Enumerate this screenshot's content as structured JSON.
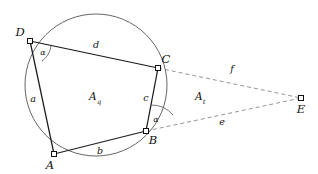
{
  "figure": {
    "canvas": {
      "width": 318,
      "height": 174
    },
    "colors": {
      "background": "#ffffff",
      "stroke_solid": "#1a1a1a",
      "stroke_circle": "#555555",
      "stroke_dashed": "#8a8a8a",
      "stroke_arc": "#555555",
      "vertex_fill": "#ffffff",
      "vertex_stroke": "#111111",
      "text": "#111111"
    },
    "circle": {
      "cx": 96,
      "cy": 85,
      "r": 71
    },
    "vertices": [
      {
        "id": "A",
        "label": "A",
        "x": 54,
        "y": 154,
        "label_x": 50,
        "label_y": 166
      },
      {
        "id": "B",
        "label": "B",
        "x": 146,
        "y": 131,
        "label_x": 153,
        "label_y": 141
      },
      {
        "id": "C",
        "label": "C",
        "x": 158,
        "y": 68,
        "label_x": 166,
        "label_y": 60
      },
      {
        "id": "D",
        "label": "D",
        "x": 30,
        "y": 41,
        "label_x": 20,
        "label_y": 33
      },
      {
        "id": "E",
        "label": "E",
        "x": 301,
        "y": 98,
        "label_x": 301,
        "label_y": 110
      }
    ],
    "solid_edges": [
      {
        "id": "DC",
        "from": "D",
        "to": "C"
      },
      {
        "id": "DA",
        "from": "D",
        "to": "A"
      },
      {
        "id": "AB",
        "from": "A",
        "to": "B"
      },
      {
        "id": "BC",
        "from": "B",
        "to": "C"
      }
    ],
    "dashed_edges": [
      {
        "id": "CE",
        "from": "C",
        "to": "E"
      },
      {
        "id": "BE",
        "from": "B",
        "to": "E"
      }
    ],
    "side_labels": [
      {
        "id": "a",
        "label": "a",
        "x": 33,
        "y": 99,
        "edge": "DA"
      },
      {
        "id": "b",
        "label": "b",
        "x": 100,
        "y": 151,
        "edge": "AB"
      },
      {
        "id": "c",
        "label": "c",
        "x": 146,
        "y": 98,
        "edge": "BC"
      },
      {
        "id": "d",
        "label": "d",
        "x": 96,
        "y": 45,
        "edge": "DC"
      },
      {
        "id": "e",
        "label": "e",
        "x": 222,
        "y": 122,
        "edge": "BE"
      },
      {
        "id": "f",
        "label": "f",
        "x": 232,
        "y": 69,
        "edge": "CE"
      }
    ],
    "angle_labels": [
      {
        "id": "alpha-D",
        "label": "α",
        "x": 43,
        "y": 53,
        "vertex": "D"
      },
      {
        "id": "alpha-B",
        "label": "α",
        "x": 156,
        "y": 120,
        "vertex": "B"
      }
    ],
    "angle_arcs": [
      {
        "id": "arc-D",
        "path": "M 42 61 A 22 22 0 0 0 51 46"
      },
      {
        "id": "arc-B",
        "path": "M 151 105 A 28 28 0 0 1 173 115"
      }
    ],
    "area_labels": [
      {
        "id": "Aq",
        "symbol": "A",
        "subscript": "q",
        "x": 95,
        "y": 98,
        "region": "quadrilateral"
      },
      {
        "id": "At",
        "symbol": "A",
        "subscript": "t",
        "x": 200,
        "y": 98,
        "region": "triangle"
      }
    ]
  }
}
